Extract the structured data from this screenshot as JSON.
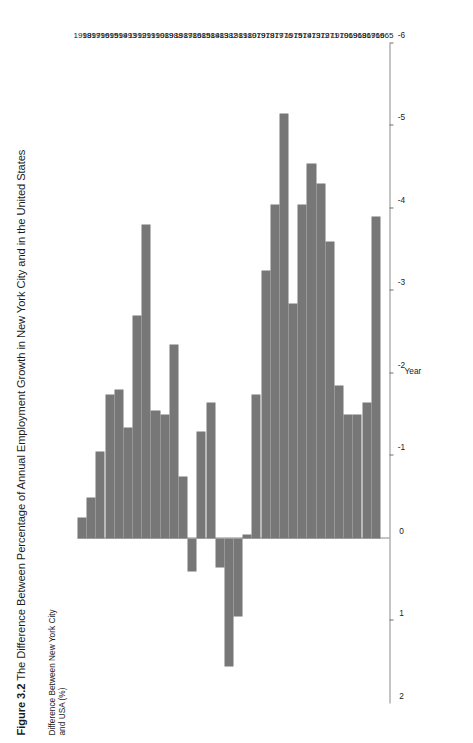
{
  "figure": {
    "number": "Figure 3.2",
    "caption": "The Difference Between Percentage of Annual Employment Growth in New York City and in the United States"
  },
  "axes": {
    "value_axis_title": "Difference Between New York City and USA (%)",
    "category_axis_title": "Year",
    "value_ticks": [
      "2",
      "1",
      "0",
      "-1",
      "-2",
      "-3",
      "-4",
      "-5",
      "-6"
    ],
    "value_tick_numbers": [
      2,
      1,
      0,
      -1,
      -2,
      -3,
      -4,
      -5,
      -6
    ]
  },
  "style": {
    "bar_color": "#777777",
    "axis_color": "#8a8a8a",
    "text_color": "#1a1a1a",
    "background": "#ffffff"
  },
  "chart_data": {
    "type": "bar",
    "orientation": "horizontal",
    "title": "Figure 3.2 The Difference Between Percentage of Annual Employment Growth in New York City and in the United States",
    "xlabel": "Difference Between New York City and USA (%)",
    "ylabel": "Year",
    "xlim": [
      2,
      -6
    ],
    "grid": false,
    "legend": null,
    "categories": [
      "1998",
      "1997",
      "1996",
      "1995",
      "1994",
      "1993",
      "1992",
      "1991",
      "1990",
      "1989",
      "1988",
      "1987",
      "1986",
      "1985",
      "1984",
      "1983",
      "1982",
      "1981",
      "1980",
      "1979",
      "1978",
      "1977",
      "1976",
      "1975",
      "1974",
      "1973",
      "1972",
      "1971",
      "1970",
      "1969",
      "1968",
      "1967",
      "1966",
      "1965"
    ],
    "values": [
      -0.25,
      -0.5,
      -1.05,
      -1.75,
      -1.8,
      -1.35,
      -2.7,
      -3.8,
      -1.55,
      -1.5,
      -2.35,
      -0.75,
      0.4,
      -1.3,
      -1.65,
      0.35,
      1.55,
      0.95,
      -0.05,
      -1.75,
      -3.25,
      -4.05,
      -5.15,
      -2.85,
      -4.05,
      -4.55,
      -4.3,
      -3.6,
      -1.85,
      -1.5,
      -1.5,
      -1.65,
      -3.9,
      0
    ],
    "value_unit": "percentage point difference"
  }
}
